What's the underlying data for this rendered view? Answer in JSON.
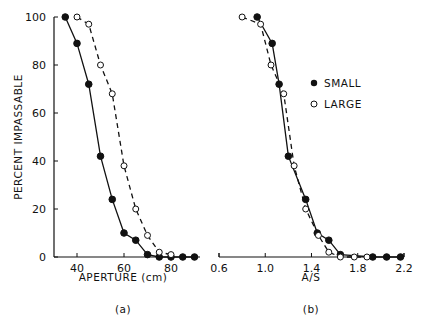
{
  "chart_data": [
    {
      "type": "line",
      "panel_label": "(a)",
      "xlabel": "APERTURE (cm)",
      "ylabel": "PERCENT IMPASSABLE",
      "xticks": [
        "40",
        "60",
        "80"
      ],
      "yticks": [
        "0",
        "20",
        "40",
        "60",
        "80",
        "100"
      ],
      "xlim": [
        30,
        93
      ],
      "ylim": [
        0,
        100
      ],
      "grid": false,
      "series": [
        {
          "name": "SMALL",
          "marker": "filled-circle",
          "line": "solid",
          "x": [
            35,
            40,
            45,
            50,
            55,
            60,
            65,
            70,
            75,
            80,
            85,
            90
          ],
          "y": [
            100,
            89,
            72,
            42,
            24,
            10,
            7,
            1,
            0,
            0,
            0,
            0
          ]
        },
        {
          "name": "LARGE",
          "marker": "open-circle",
          "line": "dashed",
          "x": [
            40,
            45,
            50,
            55,
            60,
            65,
            70,
            75,
            80
          ],
          "y": [
            100,
            97,
            80,
            68,
            38,
            20,
            9,
            2,
            1
          ]
        }
      ]
    },
    {
      "type": "line",
      "panel_label": "(b)",
      "xlabel": "A/S",
      "ylabel": "PERCENT IMPASSABLE",
      "xticks": [
        "0.6",
        "1.0",
        "1.4",
        "1.8",
        "2.2"
      ],
      "xlim": [
        0.6,
        2.2
      ],
      "ylim": [
        0,
        100
      ],
      "grid": false,
      "legend": {
        "position": "right-middle",
        "entries": [
          "SMALL",
          "LARGE"
        ]
      },
      "series": [
        {
          "name": "SMALL",
          "marker": "filled-circle",
          "line": "solid",
          "x": [
            0.93,
            1.06,
            1.12,
            1.2,
            1.35,
            1.45,
            1.55,
            1.65,
            1.93,
            2.05,
            2.17
          ],
          "y": [
            100,
            89,
            72,
            42,
            24,
            10,
            7,
            1,
            0,
            0,
            0
          ]
        },
        {
          "name": "LARGE",
          "marker": "open-circle",
          "line": "dashed",
          "x": [
            0.8,
            0.96,
            1.05,
            1.16,
            1.25,
            1.35,
            1.46,
            1.55,
            1.65,
            1.77,
            1.88
          ],
          "y": [
            100,
            97,
            80,
            68,
            38,
            20,
            9,
            2,
            0,
            0,
            0
          ]
        }
      ]
    }
  ],
  "legend": {
    "small": "SMALL",
    "large": "LARGE"
  },
  "labels": {
    "ylabel": "PERCENT IMPASSABLE",
    "xlabel_a": "APERTURE (cm)",
    "xlabel_b": "A/S",
    "panel_a": "(a)",
    "panel_b": "(b)"
  }
}
